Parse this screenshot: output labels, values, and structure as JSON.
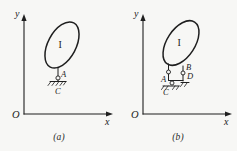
{
  "figure": {
    "background_color": "#f7f7f5",
    "ink_color": "#1f1f1f",
    "width": 237,
    "height": 151
  },
  "panels": [
    {
      "id": "a",
      "caption": "(a)",
      "axes": {
        "y_label": "y",
        "x_label": "x",
        "origin_label": "O"
      },
      "body": {
        "label": "I",
        "shape": "tilted-ellipse"
      },
      "joints": [
        {
          "label": "A",
          "type": "pin-to-body"
        },
        {
          "label": "C",
          "type": "fixed-ground-support"
        }
      ]
    },
    {
      "id": "b",
      "caption": "(b)",
      "axes": {
        "y_label": "y",
        "x_label": "x",
        "origin_label": "O"
      },
      "body": {
        "label": "I",
        "shape": "tilted-ellipse"
      },
      "joints": [
        {
          "label": "A",
          "type": "pin-to-body"
        },
        {
          "label": "B",
          "type": "pin-to-body"
        },
        {
          "label": "C",
          "type": "fixed-ground-support"
        },
        {
          "label": "D",
          "type": "fixed-ground-support"
        }
      ]
    }
  ]
}
